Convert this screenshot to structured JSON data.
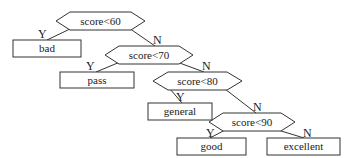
{
  "diagram": {
    "type": "decision-tree",
    "nodes": {
      "d1": {
        "label": "score<60",
        "kind": "decision"
      },
      "d2": {
        "label": "score<70",
        "kind": "decision"
      },
      "d3": {
        "label": "score<80",
        "kind": "decision"
      },
      "d4": {
        "label": "score<90",
        "kind": "decision"
      },
      "bad": {
        "label": "bad",
        "kind": "leaf"
      },
      "pass": {
        "label": "pass",
        "kind": "leaf"
      },
      "general": {
        "label": "general",
        "kind": "leaf"
      },
      "good": {
        "label": "good",
        "kind": "leaf"
      },
      "excellent": {
        "label": "excellent",
        "kind": "leaf"
      }
    },
    "branches": {
      "yes": "Y",
      "no": "N"
    },
    "edges": [
      {
        "from": "score<60",
        "to": "bad",
        "label": "Y"
      },
      {
        "from": "score<60",
        "to": "score<70",
        "label": "N"
      },
      {
        "from": "score<70",
        "to": "pass",
        "label": "Y"
      },
      {
        "from": "score<70",
        "to": "score<80",
        "label": "N"
      },
      {
        "from": "score<80",
        "to": "general",
        "label": "Y"
      },
      {
        "from": "score<80",
        "to": "score<90",
        "label": "N"
      },
      {
        "from": "score<90",
        "to": "good",
        "label": "Y"
      },
      {
        "from": "score<90",
        "to": "excellent",
        "label": "N"
      }
    ]
  }
}
